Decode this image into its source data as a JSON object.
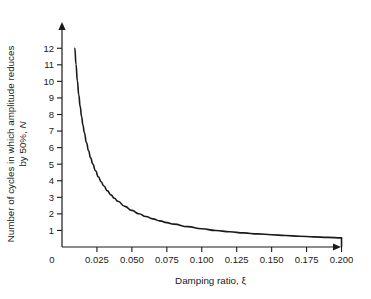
{
  "chart_data": {
    "type": "line",
    "title": "",
    "xlabel": "Damping ratio, ξ",
    "ylabel_line1": "Number of cycles in which amplitude reduces",
    "ylabel_line2_prefix": "by 50%, ",
    "ylabel_line2_symbol": "N",
    "xlim": [
      0,
      0.2125
    ],
    "ylim": [
      0,
      12.8
    ],
    "grid": false,
    "legend": null,
    "formula": "N = ln(2) / (2πξ)",
    "xticks": [
      0,
      0.025,
      0.05,
      0.075,
      0.1,
      0.125,
      0.15,
      0.175,
      0.2
    ],
    "xtick_labels": [
      "0",
      "0.025",
      "0.050",
      "0.075",
      "0.100",
      "0.125",
      "0.150",
      "0.175",
      "0.200"
    ],
    "yticks": [
      1,
      2,
      3,
      4,
      5,
      6,
      7,
      8,
      9,
      10,
      11,
      12
    ],
    "ytick_labels": [
      "1",
      "2",
      "3",
      "4",
      "5",
      "6",
      "7",
      "8",
      "9",
      "10",
      "11",
      "12"
    ],
    "origin_label": "0",
    "series": [
      {
        "name": "Cycles to 50% amplitude",
        "x": [
          0.00919,
          0.01,
          0.011,
          0.012,
          0.013,
          0.014,
          0.015,
          0.016,
          0.0175,
          0.019,
          0.0205,
          0.022,
          0.024,
          0.026,
          0.028,
          0.03,
          0.0325,
          0.035,
          0.0375,
          0.04,
          0.045,
          0.05,
          0.055,
          0.06,
          0.065,
          0.07,
          0.075,
          0.08,
          0.09,
          0.1,
          0.11,
          0.12,
          0.13,
          0.14,
          0.15,
          0.16,
          0.17,
          0.18,
          0.19,
          0.2
        ],
        "y": [
          12.0,
          11.03,
          10.03,
          9.19,
          8.49,
          7.88,
          7.35,
          6.9,
          6.3,
          5.81,
          5.38,
          5.01,
          4.6,
          4.24,
          3.94,
          3.68,
          3.39,
          3.15,
          2.94,
          2.76,
          2.45,
          2.21,
          2.01,
          1.84,
          1.7,
          1.58,
          1.47,
          1.38,
          1.23,
          1.1,
          1.0,
          0.92,
          0.85,
          0.79,
          0.74,
          0.69,
          0.65,
          0.61,
          0.58,
          0.55
        ],
        "color": "#1a1a1a",
        "line_width": 1.6,
        "end_drop_to_axis": true
      }
    ]
  },
  "style": {
    "background": "#ffffff",
    "axis_color": "#1a1a1a",
    "curve_color": "#1a1a1a"
  }
}
